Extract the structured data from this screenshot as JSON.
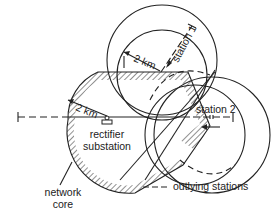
{
  "diagram": {
    "title": "",
    "labels": {
      "radius_station1": "2 km",
      "radius_core": "2 km",
      "station1": "station 1",
      "station2": "station 2",
      "rectifier_line1": "rectifier",
      "rectifier_line2": "substation",
      "core_line1": "network",
      "core_line2": "core",
      "legend_outlying": "outlying stations"
    },
    "legend": [
      {
        "style": "dashed",
        "label": "outlying stations"
      }
    ],
    "colors": {
      "line": "#222222",
      "background": "#ffffff"
    }
  }
}
